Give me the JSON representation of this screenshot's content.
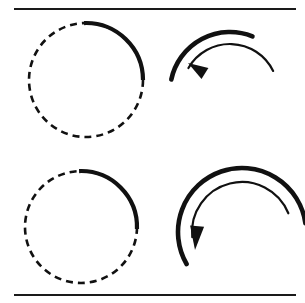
{
  "figure": {
    "background_color": "#ffffff",
    "ink_color": "#111111",
    "width": 305,
    "height": 303
  },
  "rules": {
    "top": {
      "label": "top-horizontal-rule",
      "x1": 14,
      "y1": 9,
      "x2": 296,
      "y2": 9,
      "thickness": 2
    },
    "bottom": {
      "label": "bottom-horizontal-rule",
      "x1": 14,
      "y1": 295,
      "x2": 296,
      "y2": 295,
      "thickness": 2
    }
  },
  "panels": [
    {
      "id": "top-left",
      "name": "small-rotation-circle",
      "type": "circle-with-arc",
      "center_x": 86,
      "center_y": 80,
      "radius": 57,
      "dash_pattern": "7 5",
      "dash_stroke": 2.6,
      "arc_stroke": 4.2,
      "arc_start_deg": -92,
      "arc_end_deg": 0,
      "description": "Dashed circle with bold solid arc over the upper-right quadrant"
    },
    {
      "id": "top-right",
      "name": "small-rotation-arrow",
      "type": "double-arc-arrow",
      "center_x": 230,
      "center_y": 92,
      "outer_radius": 60,
      "inner_radius": 48,
      "outer_stroke": 4.6,
      "inner_stroke": 2.2,
      "outer_start_deg": -168,
      "outer_end_deg": -68,
      "inner_start_deg": -150,
      "inner_end_deg": -26,
      "arrow_tip_x": 188,
      "arrow_tip_y": 63,
      "arrow_angle_deg": 212,
      "arrow_length": 20,
      "arrow_half_width": 6.5,
      "description": "Thick outer arc and thin inner arc with counterclockwise arrowhead pointing down-left"
    },
    {
      "id": "bottom-left",
      "name": "large-rotation-circle",
      "type": "circle-with-arc",
      "center_x": 81,
      "center_y": 227,
      "radius": 56,
      "dash_pattern": "7 5",
      "dash_stroke": 2.6,
      "arc_stroke": 4.2,
      "arc_start_deg": -92,
      "arc_end_deg": 2,
      "description": "Dashed circle with bold solid arc over the upper-right quadrant"
    },
    {
      "id": "bottom-right",
      "name": "large-rotation-arrow",
      "type": "double-arc-arrow",
      "center_x": 242,
      "center_y": 232,
      "outer_radius": 64,
      "inner_radius": 50,
      "outer_stroke": 4.6,
      "inner_stroke": 2.2,
      "outer_start_deg": -210,
      "outer_end_deg": -8,
      "inner_start_deg": -186,
      "inner_end_deg": -22,
      "arrow_tip_x": 195,
      "arrow_tip_y": 250,
      "arrow_angle_deg": 95,
      "arrow_length": 24,
      "arrow_half_width": 7,
      "description": "Thick outer arc and thin inner arc sweeping counterclockwise with a downward arrowhead"
    }
  ]
}
